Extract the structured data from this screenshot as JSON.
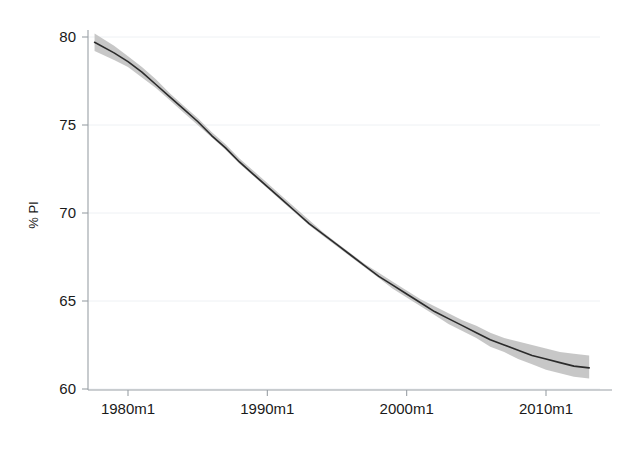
{
  "figure": {
    "width": 621,
    "height": 450,
    "background": "#ffffff"
  },
  "chart_data": {
    "type": "line",
    "title": "",
    "subtitle": "",
    "xlabel": "",
    "ylabel": "% PI",
    "grid": "horizontal",
    "legend": "none",
    "xtick_labels": [
      "1980m1",
      "1990m1",
      "2000m1",
      "2010m1"
    ],
    "xtick_values": [
      1980,
      1990,
      2000,
      2010
    ],
    "ytick_labels": [
      "60",
      "65",
      "70",
      "75",
      "80"
    ],
    "ytick_values": [
      60,
      65,
      70,
      75,
      80
    ],
    "xlim": [
      1977.6,
      2013.1
    ],
    "ylim": [
      59.4,
      81.2
    ],
    "x": [
      1977.6,
      1979.0,
      1980.0,
      1981.0,
      1982.0,
      1983.0,
      1984.0,
      1985.0,
      1986.0,
      1987.0,
      1988.0,
      1989.0,
      1990.0,
      1991.0,
      1992.0,
      1993.0,
      1994.0,
      1995.0,
      1996.0,
      1997.0,
      1998.0,
      1999.0,
      2000.0,
      2001.0,
      2002.0,
      2003.0,
      2004.0,
      2005.0,
      2006.0,
      2007.0,
      2008.0,
      2009.0,
      2010.0,
      2011.0,
      2012.0,
      2013.1
    ],
    "series": [
      {
        "name": "Fitted % PI",
        "color": "#2b2b2b",
        "values": [
          79.7,
          79.1,
          78.6,
          78.0,
          77.3,
          76.6,
          75.9,
          75.2,
          74.4,
          73.7,
          72.9,
          72.2,
          71.5,
          70.8,
          70.1,
          69.4,
          68.8,
          68.2,
          67.6,
          67.0,
          66.4,
          65.9,
          65.4,
          64.9,
          64.4,
          64.0,
          63.6,
          63.2,
          62.8,
          62.5,
          62.2,
          61.9,
          61.7,
          61.5,
          61.3,
          61.2
        ]
      }
    ],
    "confidence_band": {
      "name": "95% confidence interval",
      "color": "#c2c2c2",
      "lower": [
        79.2,
        78.7,
        78.3,
        77.7,
        77.1,
        76.4,
        75.7,
        75.0,
        74.3,
        73.6,
        72.8,
        72.1,
        71.4,
        70.7,
        70.0,
        69.3,
        68.7,
        68.1,
        67.5,
        66.9,
        66.3,
        65.7,
        65.2,
        64.7,
        64.2,
        63.7,
        63.3,
        62.9,
        62.4,
        62.1,
        61.7,
        61.4,
        61.1,
        60.9,
        60.7,
        60.6
      ],
      "upper": [
        80.2,
        79.5,
        78.9,
        78.3,
        77.6,
        76.8,
        76.1,
        75.4,
        74.6,
        73.9,
        73.1,
        72.4,
        71.7,
        71.0,
        70.3,
        69.6,
        68.9,
        68.3,
        67.7,
        67.1,
        66.6,
        66.1,
        65.6,
        65.1,
        64.7,
        64.3,
        63.9,
        63.6,
        63.2,
        62.9,
        62.7,
        62.5,
        62.3,
        62.1,
        62.0,
        61.9
      ]
    }
  },
  "axes": {
    "y_title": "% PI",
    "y_ticks": [
      {
        "label": "80",
        "value": 80
      },
      {
        "label": "75",
        "value": 75
      },
      {
        "label": "70",
        "value": 70
      },
      {
        "label": "65",
        "value": 65
      },
      {
        "label": "60",
        "value": 60
      }
    ],
    "x_ticks": [
      {
        "label": "1980m1",
        "value": 1980
      },
      {
        "label": "1990m1",
        "value": 1990
      },
      {
        "label": "2000m1",
        "value": 2000
      },
      {
        "label": "2010m1",
        "value": 2010
      }
    ]
  }
}
